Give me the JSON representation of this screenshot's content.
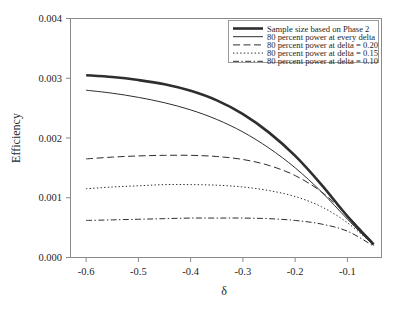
{
  "chart_data": {
    "type": "line",
    "title": "",
    "xlabel": "δ",
    "ylabel": "Efficiency",
    "xlim": [
      -0.63,
      -0.035
    ],
    "ylim": [
      0.0,
      0.004
    ],
    "xticks": [
      "-0.6",
      "-0.5",
      "-0.4",
      "-0.3",
      "-0.2",
      "-0.1"
    ],
    "xtick_values": [
      -0.6,
      -0.5,
      -0.4,
      -0.3,
      -0.2,
      -0.1
    ],
    "yticks": [
      "0.000",
      "0.001",
      "0.002",
      "0.003",
      "0.004"
    ],
    "ytick_values": [
      0.0,
      0.001,
      0.002,
      0.003,
      0.004
    ],
    "grid": false,
    "legend_position": "top-right",
    "x": [
      -0.6,
      -0.55,
      -0.5,
      -0.45,
      -0.4,
      -0.35,
      -0.3,
      -0.25,
      -0.2,
      -0.15,
      -0.1,
      -0.05
    ],
    "series": [
      {
        "name": "Sample size based on Phase 2",
        "style": "thick-solid",
        "color": "#2e2e2e",
        "values": [
          0.00305,
          0.00302,
          0.00297,
          0.0029,
          0.00279,
          0.00263,
          0.0024,
          0.00209,
          0.0017,
          0.00122,
          0.00069,
          0.00022
        ]
      },
      {
        "name": "80 percent power at every delta",
        "style": "thin-solid",
        "color": "#2e2e2e",
        "values": [
          0.0028,
          0.00275,
          0.00268,
          0.00259,
          0.00247,
          0.00231,
          0.0021,
          0.00183,
          0.0015,
          0.0011,
          0.00064,
          0.0002
        ]
      },
      {
        "name": "80 percent power at delta = 0.20",
        "style": "dashed",
        "color": "#2e2e2e",
        "values": [
          0.00165,
          0.00168,
          0.0017,
          0.00171,
          0.00171,
          0.00169,
          0.00164,
          0.00154,
          0.00137,
          0.0011,
          0.0007,
          0.00023
        ]
      },
      {
        "name": "80 percent power at delta = 0.15",
        "style": "dotted",
        "color": "#2e2e2e",
        "values": [
          0.00115,
          0.00118,
          0.0012,
          0.00122,
          0.00122,
          0.00121,
          0.00118,
          0.00112,
          0.00102,
          0.00085,
          0.00058,
          0.00021
        ]
      },
      {
        "name": "80 percent power at delta = 0.10",
        "style": "dash-dot",
        "color": "#2e2e2e",
        "values": [
          0.00062,
          0.00063,
          0.00064,
          0.00065,
          0.00066,
          0.00066,
          0.00066,
          0.00065,
          0.00062,
          0.00056,
          0.00044,
          0.00019
        ]
      }
    ]
  },
  "legend": {
    "entries": [
      {
        "label": "Sample size based on Phase 2",
        "style": "thick-solid"
      },
      {
        "label": "80 percent power at every delta",
        "style": "thin-solid"
      },
      {
        "label": "80 percent power at delta = 0.20",
        "style": "dashed"
      },
      {
        "label": "80 percent power at delta = 0.15",
        "style": "dotted"
      },
      {
        "label": "80 percent power at delta = 0.10",
        "style": "dash-dot"
      }
    ]
  }
}
